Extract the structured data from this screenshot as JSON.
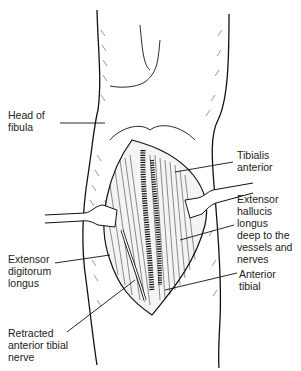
{
  "figure": {
    "type": "anatomical-illustration"
  },
  "labels": {
    "head_of_fibula": "Head of\nfibula",
    "tibialis_anterior": "Tibialis\nanterior",
    "extensor_hallucis_longus": "Extensor\nhallucis\nlongus\ndeep to the\nvessels and\nnerves",
    "extensor_digitorum_longus": "Extensor\ndigitorum\nlongus",
    "anterior_tibial": "Anterior\ntibial",
    "retracted_anterior_tibial_nerve": "Retracted\nanterior tibial\nnerve"
  }
}
